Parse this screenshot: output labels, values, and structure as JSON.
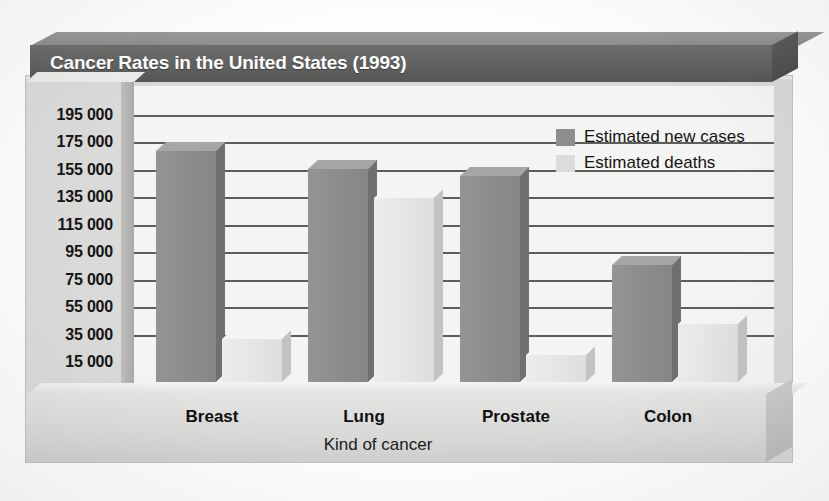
{
  "chart_data": {
    "type": "bar",
    "title": "Cancer Rates in the United States (1993)",
    "xlabel": "Kind of cancer",
    "ylabel": "",
    "categories": [
      "Breast",
      "Lung",
      "Prostate",
      "Colon"
    ],
    "series": [
      {
        "name": "Estimated new cases",
        "color": "#8e8e8c",
        "values": [
          183000,
          170000,
          165000,
          100000
        ]
      },
      {
        "name": "Estimated deaths",
        "color": "#dcdcda",
        "values": [
          46000,
          149000,
          35000,
          57000
        ]
      }
    ],
    "ylim": [
      15000,
      195000
    ],
    "ytick_values": [
      195000,
      175000,
      155000,
      135000,
      115000,
      95000,
      75000,
      55000,
      35000,
      15000
    ],
    "ytick_labels": [
      "195 000",
      "175 000",
      "155 000",
      "135 000",
      "115 000",
      "95 000",
      "75 000",
      "55 000",
      "35 000",
      "15 000"
    ],
    "grid": true,
    "legend_position": "upper right",
    "style": "3d-bar"
  },
  "title": {
    "text": "Cancer Rates in the United States (1993)"
  },
  "axes": {
    "x_title": "Kind of cancer",
    "x_labels": [
      "Breast",
      "Lung",
      "Prostate",
      "Colon"
    ],
    "y_labels": [
      "195 000",
      "175 000",
      "155 000",
      "135 000",
      "115 000",
      "95 000",
      "75 000",
      "55 000",
      "35 000",
      "15 000"
    ]
  },
  "legend": {
    "items": [
      {
        "label": "Estimated new cases",
        "color": "#8e8e8c"
      },
      {
        "label": "Estimated deaths",
        "color": "#dcdcda"
      }
    ]
  },
  "colors": {
    "title_bar": "#616160",
    "series_cases": "#8e8e8c",
    "series_deaths": "#dcdcda",
    "plot_background": "#f4f4f2",
    "gridline": "#5d5d5b",
    "slab": "#d8d8d6"
  }
}
